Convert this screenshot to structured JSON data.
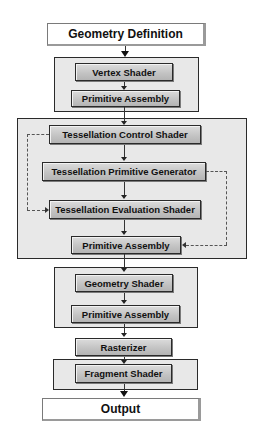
{
  "diagram": {
    "input": {
      "label": "Geometry Definition"
    },
    "output": {
      "label": "Output"
    },
    "groups": {
      "vertex": {
        "stages": [
          {
            "label": "Vertex Shader"
          },
          {
            "label": "Primitive Assembly"
          }
        ]
      },
      "tessellation": {
        "stages": [
          {
            "label": "Tessellation Control Shader"
          },
          {
            "label": "Tessellation Primitive Generator"
          },
          {
            "label": "Tessellation Evaluation Shader"
          },
          {
            "label": "Primitive Assembly"
          }
        ]
      },
      "geometry": {
        "stages": [
          {
            "label": "Geometry Shader"
          },
          {
            "label": "Primitive Assembly"
          }
        ]
      },
      "fragment": {
        "stages": [
          {
            "label": "Fragment Shader"
          }
        ]
      }
    },
    "rasterizer": {
      "label": "Rasterizer"
    },
    "edges": [
      {
        "from": "Geometry Definition",
        "to": "Vertex Shader",
        "style": "solid"
      },
      {
        "from": "Vertex Shader",
        "to": "Primitive Assembly",
        "style": "solid"
      },
      {
        "from": "Primitive Assembly",
        "to": "Tessellation Control Shader",
        "style": "solid"
      },
      {
        "from": "Tessellation Control Shader",
        "to": "Tessellation Primitive Generator",
        "style": "solid"
      },
      {
        "from": "Tessellation Control Shader",
        "to": "Tessellation Evaluation Shader",
        "style": "dashed"
      },
      {
        "from": "Tessellation Primitive Generator",
        "to": "Tessellation Evaluation Shader",
        "style": "solid"
      },
      {
        "from": "Tessellation Primitive Generator",
        "to": "Primitive Assembly",
        "style": "dashed"
      },
      {
        "from": "Tessellation Evaluation Shader",
        "to": "Primitive Assembly",
        "style": "solid"
      },
      {
        "from": "Primitive Assembly",
        "to": "Geometry Shader",
        "style": "solid"
      },
      {
        "from": "Geometry Shader",
        "to": "Primitive Assembly",
        "style": "solid"
      },
      {
        "from": "Primitive Assembly",
        "to": "Rasterizer",
        "style": "solid"
      },
      {
        "from": "Rasterizer",
        "to": "Fragment Shader",
        "style": "solid"
      },
      {
        "from": "Fragment Shader",
        "to": "Output",
        "style": "solid"
      }
    ],
    "colors": {
      "group_fill": "#e8e8e8",
      "stage_fill": "#c4c4c4",
      "border": "#2a2a2a",
      "io_fill": "#ffffff"
    }
  }
}
